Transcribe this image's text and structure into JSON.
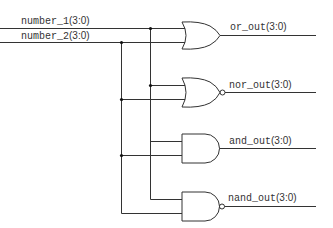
{
  "diagram": {
    "type": "logic-gate-schematic",
    "inputs": [
      {
        "name": "number_1",
        "width": "(3:0)"
      },
      {
        "name": "number_2",
        "width": "(3:0)"
      }
    ],
    "gates": [
      {
        "type": "OR",
        "output_name": "or_out",
        "output_width": "(3:0)"
      },
      {
        "type": "NOR",
        "output_name": "nor_out",
        "output_width": "(3:0)"
      },
      {
        "type": "AND",
        "output_name": "and_out",
        "output_width": "(3:0)"
      },
      {
        "type": "NAND",
        "output_name": "nand_out",
        "output_width": "(3:0)"
      }
    ],
    "colors": {
      "wire": "#333333",
      "background": "#ffffff"
    }
  }
}
